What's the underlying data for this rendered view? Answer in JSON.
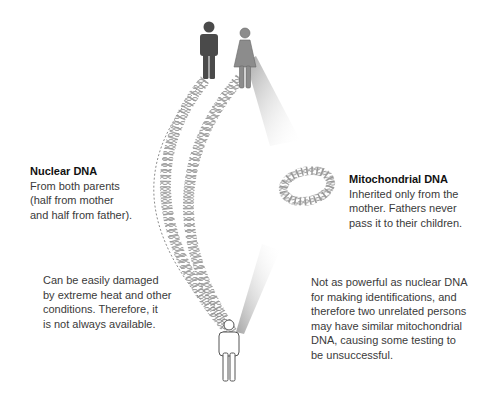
{
  "nuclear": {
    "title": "Nuclear DNA",
    "lines": [
      "From both parents",
      "(half from mother",
      "and half from father)."
    ]
  },
  "mitochondrial": {
    "title": "Mitochondrial DNA",
    "lines": [
      "Inherited only from the",
      "mother. Fathers never",
      "pass it to their children."
    ]
  },
  "nuclear_note": {
    "lines": [
      "Can be easily damaged",
      "by extreme heat and other",
      "conditions. Therefore, it",
      "is not always available."
    ]
  },
  "mito_note": {
    "lines": [
      "Not as powerful as nuclear DNA",
      "for making identifications, and",
      "therefore two unrelated persons",
      "may have similar mitochondrial",
      "DNA, causing some testing to",
      "be unsuccessful."
    ]
  },
  "figures": {
    "father_color": "#4a4a4a",
    "mother_color": "#8a8a8a",
    "child_color": "#ffffff"
  }
}
